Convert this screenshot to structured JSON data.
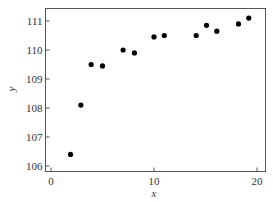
{
  "chart_data": {
    "type": "scatter",
    "title": "",
    "xlabel": "x",
    "ylabel": "y",
    "xlim": [
      -0.6,
      20.8
    ],
    "ylim": [
      105.85,
      111.45
    ],
    "xticks": [
      0,
      10,
      20
    ],
    "yticks": [
      106,
      107,
      108,
      109,
      110,
      111
    ],
    "grid": false,
    "legend": null,
    "series": [
      {
        "name": "data",
        "color": "#000000",
        "x": [
          1.9,
          2.9,
          3.9,
          5.0,
          7.0,
          8.1,
          10.0,
          11.0,
          14.1,
          15.1,
          16.1,
          18.2,
          19.2
        ],
        "y": [
          106.4,
          108.1,
          109.5,
          109.45,
          110.0,
          109.9,
          110.45,
          110.5,
          110.5,
          110.85,
          110.65,
          110.9,
          111.1
        ]
      }
    ]
  },
  "axes": {
    "x_tick_labels": [
      "0",
      "10",
      "20"
    ],
    "y_tick_labels": [
      "106",
      "107",
      "108",
      "109",
      "110",
      "111"
    ],
    "x_label": "x",
    "y_label": "y"
  },
  "colors": {
    "axis": "#555555",
    "point": "#000000",
    "text": "#333333"
  }
}
